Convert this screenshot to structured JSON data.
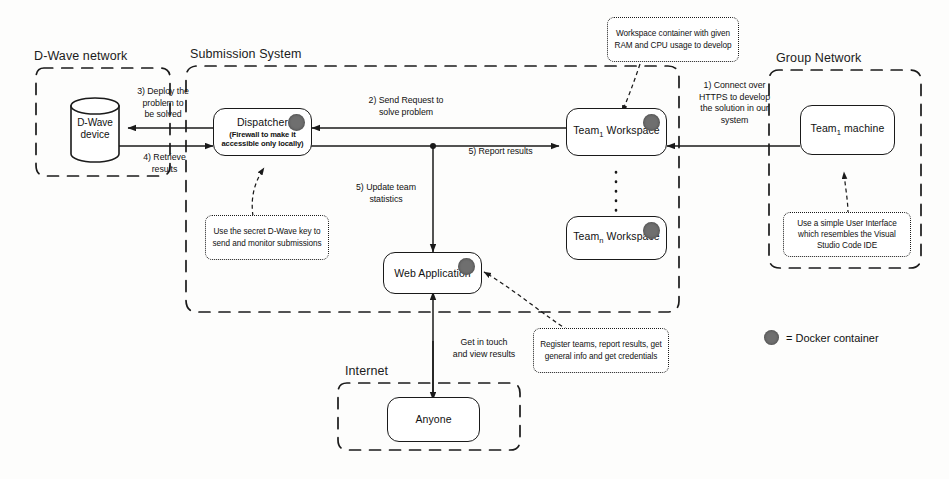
{
  "diagram": {
    "zones": [
      {
        "id": "dwave-network",
        "label": "D-Wave network"
      },
      {
        "id": "submission-system",
        "label": "Submission System"
      },
      {
        "id": "group-network",
        "label": "Group Network"
      },
      {
        "id": "internet",
        "label": "Internet"
      }
    ],
    "nodes": [
      {
        "id": "dwave-device",
        "label": "D-Wave\ndevice",
        "shape": "cylinder",
        "docker": false
      },
      {
        "id": "dispatcher",
        "title": "Dispatcher",
        "subtitle": "(Firewall to make it accessible only locally)",
        "shape": "rounded-rect",
        "docker": true
      },
      {
        "id": "web-application",
        "title": "Web Application",
        "shape": "rounded-rect",
        "docker": true
      },
      {
        "id": "team1-workspace",
        "title_pre": "Team",
        "title_sub": "1",
        "title_post": " Workspace",
        "shape": "rounded-rect",
        "docker": true
      },
      {
        "id": "teamn-workspace",
        "title_pre": "Team",
        "title_sub": "n",
        "title_post": " Workspace",
        "shape": "rounded-rect",
        "docker": true
      },
      {
        "id": "team1-machine",
        "title_pre": "Team",
        "title_sub": "1",
        "title_post": " machine",
        "shape": "rounded-rect",
        "docker": false
      },
      {
        "id": "anyone",
        "title": "Anyone",
        "shape": "rounded-rect",
        "docker": false
      }
    ],
    "edge_labels": [
      {
        "id": "deploy-problem",
        "text": "3) Deploy the\nproblem to\nbe solved"
      },
      {
        "id": "retrieve-results",
        "text": "4) Retrieve\nresults"
      },
      {
        "id": "send-request",
        "text": "2) Send Request to\nsolve problem"
      },
      {
        "id": "report-results",
        "text": "5) Report results"
      },
      {
        "id": "update-stats",
        "text": "5) Update team\nstatistics"
      },
      {
        "id": "connect-https",
        "text": "1) Connect over\nHTTPS to develop\nthe solution in our\nsystem"
      },
      {
        "id": "get-in-touch",
        "text": "Get in touch\nand view results"
      }
    ],
    "callouts": [
      {
        "id": "workspace-container-note",
        "text": "Workspace container with given RAM and CPU usage to develop"
      },
      {
        "id": "dwave-key-note",
        "text": "Use the secret D-Wave key to send and monitor submissions"
      },
      {
        "id": "vscode-note",
        "text": "Use a simple User Interface which resembles the Visual Studio Code IDE"
      },
      {
        "id": "web-app-note",
        "text": "Register teams, report results, get general info and get credentials"
      }
    ],
    "legend": {
      "symbol": "docker-container-dot",
      "text": "= Docker container"
    },
    "colors": {
      "stroke": "#1a1a1a",
      "docker": "#6f6f6f",
      "background": "#fdfdfc"
    }
  }
}
